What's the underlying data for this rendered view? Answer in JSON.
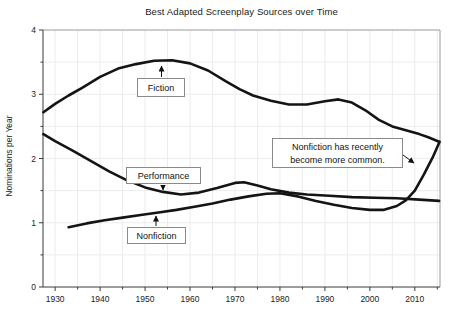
{
  "title": "Best Adapted Screenplay Sources over Time",
  "colors": {
    "line": "#141414",
    "axis_dark": "#3a3a3a",
    "frame_light": "#9a9a9a",
    "grid": "#ececec",
    "tick_text": "#222222",
    "arrow": "#111111",
    "background": "#ffffff"
  },
  "labels": {
    "fiction": "Fiction",
    "performance": "Performance",
    "nonfiction": "Nonfiction",
    "note_line1": "Nonfiction has recently",
    "note_line2": "become more common."
  },
  "chart_data": {
    "type": "line",
    "title": "Best Adapted Screenplay Sources over Time",
    "xlabel": "",
    "ylabel": "Nominations per Year",
    "xlim": [
      1927.3,
      2015.6
    ],
    "ylim": [
      0,
      4
    ],
    "grid": true,
    "x_major_ticks": [
      1930,
      1940,
      1950,
      1960,
      1970,
      1980,
      1990,
      2000,
      2010
    ],
    "x_minor_ticks": [
      1935,
      1945,
      1955,
      1965,
      1975,
      1985,
      1995,
      2005,
      2015
    ],
    "y_major_ticks": [
      0,
      1,
      2,
      3,
      4
    ],
    "y_minor_ticks": [
      0.5,
      1.5,
      2.5,
      3.5
    ],
    "grid_x_years": [
      1930,
      1935,
      1940,
      1945,
      1950,
      1955,
      1960,
      1965,
      1970,
      1975,
      1980,
      1985,
      1990,
      1995,
      2000,
      2005,
      2010,
      2015
    ],
    "grid_y_values": [
      0.5,
      1,
      1.5,
      2,
      2.5,
      3,
      3.5
    ],
    "plot_rect": {
      "left": 43,
      "top": 30,
      "right": 440,
      "bottom": 287
    },
    "series": [
      {
        "name": "Fiction",
        "points": [
          [
            1927.4,
            2.72
          ],
          [
            1930,
            2.85
          ],
          [
            1933,
            2.98
          ],
          [
            1936,
            3.1
          ],
          [
            1940,
            3.27
          ],
          [
            1944,
            3.4
          ],
          [
            1948,
            3.47
          ],
          [
            1952,
            3.52
          ],
          [
            1956,
            3.53
          ],
          [
            1960,
            3.48
          ],
          [
            1964,
            3.37
          ],
          [
            1968,
            3.2
          ],
          [
            1971,
            3.08
          ],
          [
            1974,
            2.98
          ],
          [
            1978,
            2.9
          ],
          [
            1982,
            2.84
          ],
          [
            1986,
            2.84
          ],
          [
            1990,
            2.89
          ],
          [
            1993,
            2.92
          ],
          [
            1996,
            2.87
          ],
          [
            1999,
            2.75
          ],
          [
            2002,
            2.6
          ],
          [
            2005,
            2.5
          ],
          [
            2008,
            2.44
          ],
          [
            2011,
            2.38
          ],
          [
            2013,
            2.33
          ],
          [
            2015.4,
            2.26
          ]
        ]
      },
      {
        "name": "Performance",
        "points": [
          [
            1927.4,
            2.38
          ],
          [
            1930,
            2.27
          ],
          [
            1934,
            2.12
          ],
          [
            1938,
            1.96
          ],
          [
            1942,
            1.8
          ],
          [
            1946,
            1.66
          ],
          [
            1950,
            1.55
          ],
          [
            1954,
            1.48
          ],
          [
            1958,
            1.44
          ],
          [
            1962,
            1.47
          ],
          [
            1966,
            1.54
          ],
          [
            1970,
            1.62
          ],
          [
            1972,
            1.63
          ],
          [
            1975,
            1.58
          ],
          [
            1978,
            1.52
          ],
          [
            1982,
            1.47
          ],
          [
            1986,
            1.44
          ],
          [
            1991,
            1.42
          ],
          [
            1996,
            1.4
          ],
          [
            2001,
            1.39
          ],
          [
            2006,
            1.38
          ],
          [
            2011,
            1.36
          ],
          [
            2015.4,
            1.34
          ]
        ]
      },
      {
        "name": "Nonfiction",
        "points": [
          [
            1933,
            0.93
          ],
          [
            1937,
            0.99
          ],
          [
            1941,
            1.04
          ],
          [
            1945,
            1.08
          ],
          [
            1949,
            1.12
          ],
          [
            1953,
            1.16
          ],
          [
            1957,
            1.2
          ],
          [
            1961,
            1.25
          ],
          [
            1965,
            1.3
          ],
          [
            1969,
            1.36
          ],
          [
            1973,
            1.41
          ],
          [
            1977,
            1.45
          ],
          [
            1980,
            1.46
          ],
          [
            1984,
            1.41
          ],
          [
            1988,
            1.34
          ],
          [
            1992,
            1.28
          ],
          [
            1996,
            1.23
          ],
          [
            2000,
            1.2
          ],
          [
            2003,
            1.2
          ],
          [
            2006,
            1.26
          ],
          [
            2008,
            1.35
          ],
          [
            2010,
            1.5
          ],
          [
            2012,
            1.75
          ],
          [
            2014,
            2.02
          ],
          [
            2015.5,
            2.26
          ]
        ]
      }
    ],
    "annotations": [
      {
        "name": "fiction-label",
        "text": "Fiction",
        "arrow": [
          161.5,
          77,
          161.5,
          66
        ]
      },
      {
        "name": "performance-label",
        "text": "Performance",
        "arrow": [
          163,
          185,
          163,
          190
        ]
      },
      {
        "name": "nonfiction-label",
        "text": "Nonfiction",
        "arrow": [
          156,
          226,
          156,
          216
        ]
      },
      {
        "name": "nonfiction-note",
        "text": "Nonfiction has recently become more common.",
        "arrow": [
          403,
          155,
          414,
          163
        ]
      }
    ]
  }
}
